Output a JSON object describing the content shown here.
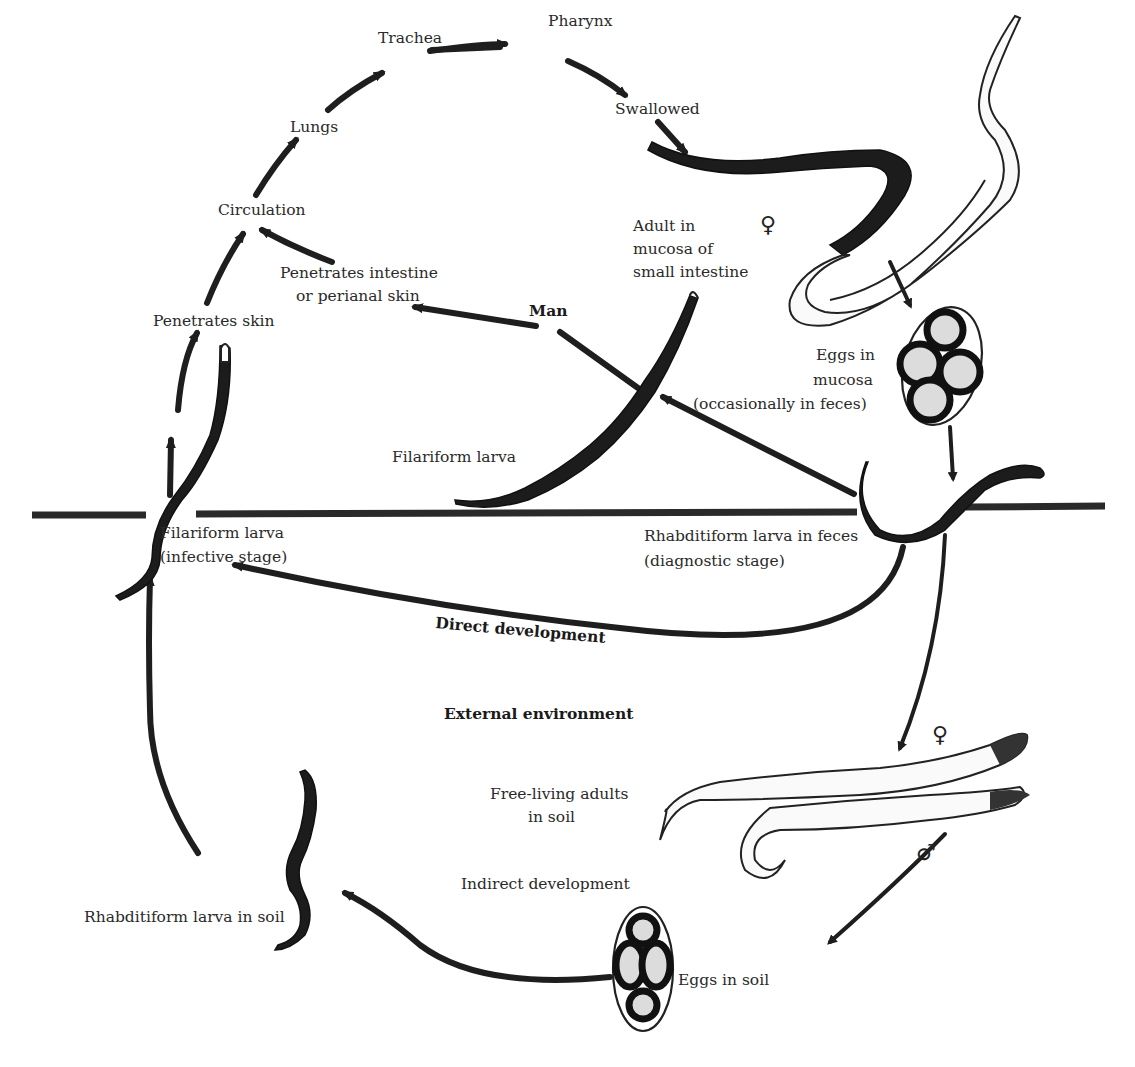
{
  "diagram": {
    "zones": {
      "host": "Man",
      "environment": "External environment"
    },
    "labels": {
      "pharynx": "Pharynx",
      "trachea": "Trachea",
      "lungs": "Lungs",
      "circulation": "Circulation",
      "swallowed": "Swallowed",
      "penetrates_skin": "Penetrates skin",
      "penetrates_intestine_1": "Penetrates intestine",
      "penetrates_intestine_2": "or perianal skin",
      "adult_mucosa_1": "Adult in",
      "adult_mucosa_2": "mucosa of",
      "adult_mucosa_3": "small intestine",
      "eggs_mucosa_1": "Eggs in",
      "eggs_mucosa_2": "mucosa",
      "eggs_mucosa_3": "(occasionally in feces)",
      "filariform_larva": "Filariform larva",
      "filariform_infective_1": "Filariform larva",
      "filariform_infective_2": "(infective stage)",
      "rhabditiform_feces_1": "Rhabditiform larva in feces",
      "rhabditiform_feces_2": "(diagnostic stage)",
      "direct_development": "Direct development",
      "free_living_1": "Free-living adults",
      "free_living_2": "in soil",
      "indirect_development": "Indirect development",
      "rhabditiform_soil": "Rhabditiform larva in soil",
      "eggs_soil": "Eggs in soil"
    },
    "symbols": {
      "female_adult": "♀",
      "female_free": "♀",
      "male_free": "♂"
    },
    "colors": {
      "ink": "#1e1e1e",
      "background": "#ffffff"
    }
  }
}
